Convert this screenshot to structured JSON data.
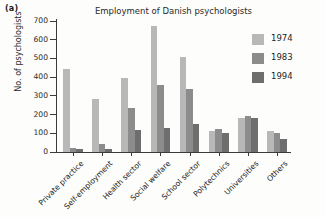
{
  "panel": {
    "label": "(a)"
  },
  "chart_data": {
    "type": "bar",
    "title": "Employment of Danish psychologists",
    "xlabel": "",
    "ylabel": "No. of psychologists",
    "ylim": [
      0,
      700
    ],
    "yticks": [
      0,
      100,
      200,
      300,
      400,
      500,
      600,
      700
    ],
    "grid": false,
    "legend_position": "right",
    "categories": [
      "Private practice",
      "Self-employment",
      "Health sector",
      "Social welfare",
      "School sector",
      "Polytechnics",
      "Universities",
      "Others"
    ],
    "series": [
      {
        "name": "1974",
        "color": "#b8b8b8",
        "values": [
          443,
          282,
          394,
          674,
          508,
          110,
          181,
          112
        ]
      },
      {
        "name": "1983",
        "color": "#8c8c8c",
        "values": [
          20,
          45,
          236,
          359,
          337,
          124,
          193,
          104
        ]
      },
      {
        "name": "1994",
        "color": "#6e6e6e",
        "values": [
          17,
          15,
          119,
          130,
          151,
          102,
          183,
          70
        ]
      }
    ]
  },
  "legend": {
    "entries": [
      {
        "label": "1974",
        "color": "#b8b8b8"
      },
      {
        "label": "1983",
        "color": "#8c8c8c"
      },
      {
        "label": "1994",
        "color": "#6e6e6e"
      }
    ]
  },
  "axis": {
    "y_min": 0,
    "y_max": 700,
    "y_tick_labels": [
      "700",
      "600",
      "500",
      "400",
      "300",
      "200",
      "100",
      "0"
    ]
  }
}
